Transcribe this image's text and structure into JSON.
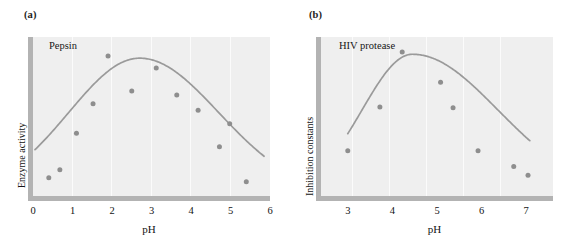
{
  "figure": {
    "panels": [
      {
        "key": "a",
        "label": "(a)",
        "series_title": "Pepsin",
        "y_axis_title": "Enzyme activity",
        "x_axis_title": "pH"
      },
      {
        "key": "b",
        "label": "(b)",
        "series_title": "HIV protease",
        "y_axis_title": "Inhibition constants",
        "x_axis_title": "pH"
      }
    ]
  },
  "colors": {
    "plot_background": "#efefef",
    "axis_bar": "#b3b3b3",
    "gridline": "#fbfbfb",
    "curve": "#9a9a9a",
    "marker": "#8e8e8e",
    "text": "#141414",
    "page_background": "#ffffff"
  },
  "chart_data": [
    {
      "type": "scatter",
      "panel": "a",
      "title": "Pepsin",
      "xlabel": "pH",
      "ylabel": "Enzyme activity",
      "xlim": [
        0,
        6
      ],
      "ylim": [
        0,
        1
      ],
      "xticks": [
        0,
        1,
        2,
        3,
        4,
        5,
        6
      ],
      "xticklabels": [
        "0",
        "1",
        "2",
        "3",
        "4",
        "5",
        "6"
      ],
      "yticks": [],
      "yticklabels": [],
      "grid": "vertical",
      "legend": "none",
      "points": [
        {
          "x": 0.4,
          "y": 0.115
        },
        {
          "x": 0.68,
          "y": 0.165
        },
        {
          "x": 1.1,
          "y": 0.395
        },
        {
          "x": 1.52,
          "y": 0.58
        },
        {
          "x": 1.9,
          "y": 0.88
        },
        {
          "x": 2.5,
          "y": 0.66
        },
        {
          "x": 3.12,
          "y": 0.805
        },
        {
          "x": 3.64,
          "y": 0.635
        },
        {
          "x": 4.18,
          "y": 0.54
        },
        {
          "x": 4.72,
          "y": 0.31
        },
        {
          "x": 4.98,
          "y": 0.455
        },
        {
          "x": 5.4,
          "y": 0.09
        }
      ],
      "fit_curve": {
        "name": "bell-shaped pH-activity fit",
        "peak_x": 2.7,
        "x_start": 0.05,
        "x_end": 5.85
      }
    },
    {
      "type": "scatter",
      "panel": "b",
      "title": "HIV protease",
      "xlabel": "pH",
      "ylabel": "Inhibition constants",
      "xlim": [
        2.4,
        7.6
      ],
      "ylim": [
        0,
        1
      ],
      "xticks": [
        3,
        4,
        5,
        6,
        7
      ],
      "xticklabels": [
        "3",
        "4",
        "5",
        "6",
        "7"
      ],
      "yticks": [],
      "yticklabels": [],
      "grid": "vertical",
      "legend": "none",
      "points": [
        {
          "x": 3.0,
          "y": 0.285
        },
        {
          "x": 3.72,
          "y": 0.56
        },
        {
          "x": 4.22,
          "y": 0.905
        },
        {
          "x": 5.08,
          "y": 0.715
        },
        {
          "x": 5.36,
          "y": 0.555
        },
        {
          "x": 5.92,
          "y": 0.285
        },
        {
          "x": 6.72,
          "y": 0.185
        },
        {
          "x": 7.04,
          "y": 0.13
        }
      ],
      "fit_curve": {
        "name": "bell-shaped pH-Ki fit",
        "peak_x": 4.45,
        "x_start": 3.0,
        "x_end": 7.08
      }
    }
  ]
}
